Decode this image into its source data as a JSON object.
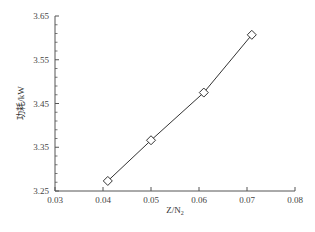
{
  "chart_data": {
    "type": "line",
    "title": "",
    "xlabel": "Z/N",
    "xlabel_subscript": "2",
    "ylabel": "功耗/kW",
    "xlim": [
      0.03,
      0.08
    ],
    "ylim": [
      3.25,
      3.65
    ],
    "x_ticks": [
      "0.03",
      "0.04",
      "0.05",
      "0.06",
      "0.07",
      "0.08"
    ],
    "y_ticks": [
      "3.25",
      "3.35",
      "3.45",
      "3.55",
      "3.65"
    ],
    "grid": false,
    "legend": null,
    "series": [
      {
        "name": "功耗",
        "marker": "diamond-open",
        "color": "#333333",
        "x": [
          0.041,
          0.05,
          0.061,
          0.071
        ],
        "y": [
          3.273,
          3.366,
          3.475,
          3.607
        ]
      }
    ]
  }
}
